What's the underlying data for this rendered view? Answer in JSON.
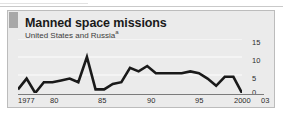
{
  "panel": {
    "title": "Manned space missions",
    "subtitle": "United States and Russia",
    "subtitle_note": "a"
  },
  "chart_data": {
    "type": "line",
    "title": "Manned space missions",
    "subtitle": "United States and Russia",
    "xlabel": "",
    "ylabel": "",
    "xlim": [
      1977,
      2003
    ],
    "ylim": [
      0,
      15
    ],
    "grid": true,
    "grid_values": [
      0,
      5,
      10,
      15
    ],
    "y_ticks": [
      "0",
      "5",
      "10",
      "15"
    ],
    "y_tick_values": [
      0,
      5,
      10,
      15
    ],
    "y_axis_position": "right",
    "x_ticks": [
      "1977",
      "80",
      "85",
      "90",
      "95",
      "2000",
      "03"
    ],
    "x_tick_values": [
      1977,
      1980,
      1985,
      1990,
      1995,
      2000,
      2003
    ],
    "legend": [],
    "line_color": "#1a1a1a",
    "x": [
      1977,
      1978,
      1979,
      1980,
      1981,
      1982,
      1983,
      1984,
      1985,
      1986,
      1987,
      1988,
      1989,
      1990,
      1991,
      1992,
      1993,
      1994,
      1995,
      1996,
      1997,
      1998,
      1999,
      2000,
      2001,
      2002,
      2003
    ],
    "values": [
      1,
      4,
      0,
      3,
      3,
      3.5,
      4,
      3,
      10,
      1,
      1,
      2.5,
      3,
      7,
      6,
      7.5,
      5.5,
      5.5,
      5.5,
      5.5,
      6,
      5.5,
      4,
      2,
      4.5,
      4.5,
      0
    ],
    "series": [
      {
        "name": "United States and Russia",
        "values": [
          1,
          4,
          0,
          3,
          3,
          3.5,
          4,
          3,
          10,
          1,
          1,
          2.5,
          3,
          7,
          6,
          7.5,
          5.5,
          5.5,
          5.5,
          5.5,
          6,
          5.5,
          4,
          2,
          4.5,
          4.5,
          0
        ]
      }
    ]
  },
  "axis": {
    "y_labels": [
      {
        "text": "15",
        "top": 28
      },
      {
        "text": "10",
        "top": 46
      },
      {
        "text": "5",
        "top": 64
      },
      {
        "text": "0",
        "top": 79
      }
    ],
    "x_labels": [
      {
        "text": "1977",
        "left": 10
      },
      {
        "text": "80",
        "left": 42
      },
      {
        "text": "85",
        "left": 90
      },
      {
        "text": "90",
        "left": 139
      },
      {
        "text": "95",
        "left": 187
      },
      {
        "text": "2000",
        "left": 228
      },
      {
        "text": "03",
        "left": 256
      }
    ]
  },
  "colors": {
    "panel_bg": "#ebebeb",
    "panel_border": "#bcbcbc",
    "accent": "#a8a8a8",
    "line": "#1a1a1a",
    "grid": "#f7f7f7",
    "axis": "#7b7b7b",
    "text": "#1a1a1a"
  }
}
